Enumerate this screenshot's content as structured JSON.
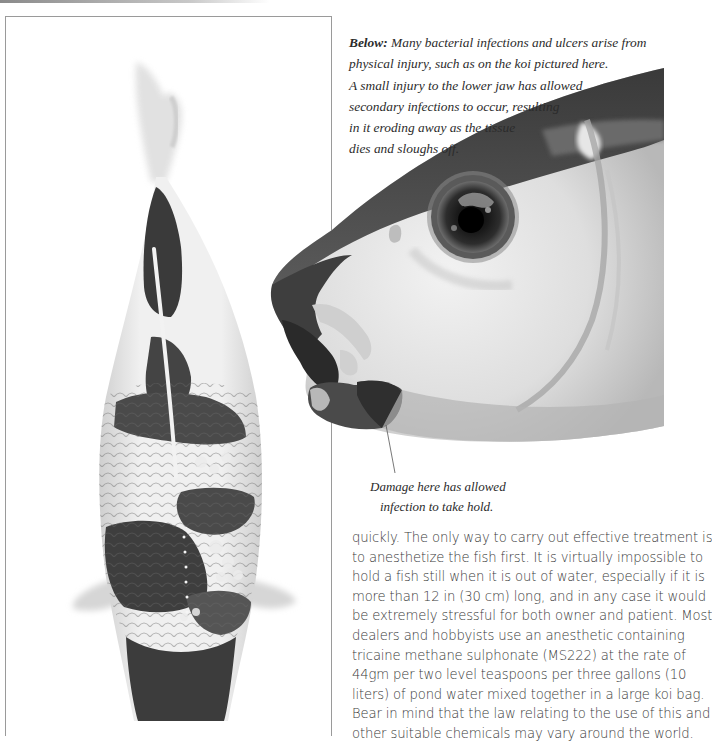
{
  "page": {
    "type": "book-page",
    "palette": {
      "paper": "#ffffff",
      "ink": "#2b2b2b",
      "frame": "#9a9a9a",
      "photo_dark": "#3c3c3c",
      "photo_light": "#e6e6e6"
    }
  },
  "figures": {
    "left_photo": {
      "subject": "koi-top-view",
      "framed": true
    },
    "right_photo": {
      "subject": "koi-head-close-up-jaw-injury",
      "framed": false
    }
  },
  "caption": {
    "lead": "Below:",
    "lines": [
      " Many bacterial infections and ulcers arise from",
      "physical injury, such as on the koi pictured here.",
      "A small injury to the lower jaw has allowed",
      "secondary infections to occur, resulting",
      "in it eroding away as the tissue",
      "dies and sloughs off."
    ]
  },
  "annotation": {
    "lines": [
      "Damage here has allowed",
      "infection to take hold."
    ]
  },
  "body_text": {
    "lines": [
      "quickly. The only way to carry out effective treatment is",
      "to anesthetize the fish first. It is virtually impossible to",
      "hold a fish still when it is out of water, especially if it is",
      "more than 12 in (30 cm) long, and in any case it would",
      "be extremely stressful for both owner and patient. Most",
      "dealers and hobbyists use an anesthetic containing",
      "tricaine methane sulphonate (MS222) at the rate of",
      "44gm per two level teaspoons per three gallons (10",
      "liters) of pond water mixed together in a large koi bag.",
      "Bear in mind that the law relating to the use of this and",
      "other suitable chemicals may vary around the world."
    ]
  }
}
